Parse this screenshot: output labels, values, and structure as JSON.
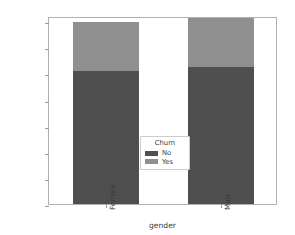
{
  "chart_data": {
    "type": "bar",
    "subtype": "stacked-bar",
    "title": "",
    "xlabel": "gender",
    "ylabel": "",
    "categories": [
      "Female",
      "Male"
    ],
    "series": [
      {
        "name": "No",
        "color": "#4f4f4f",
        "values": [
          2549,
          2625
        ]
      },
      {
        "name": "Yes",
        "color": "#8f8f8f",
        "values": [
          939,
          930
        ]
      }
    ],
    "totals": [
      3488,
      3555
    ],
    "ylim": [
      0,
      3600
    ],
    "yticks": [
      0,
      500,
      1000,
      1500,
      2000,
      2500,
      3000,
      3500
    ],
    "ytick_labels": [
      "0",
      "500",
      "1000",
      "1500",
      "2000",
      "2500",
      "3000",
      "3500"
    ],
    "xtick_labels": [
      "Female",
      "Male"
    ],
    "xtick_rotation": 90,
    "grid": false,
    "legend": {
      "title": "Churn",
      "position": "center",
      "entries": [
        {
          "label": "No",
          "color": "#4f4f4f"
        },
        {
          "label": "Yes",
          "color": "#8f8f8f"
        }
      ]
    },
    "colors": {
      "series_no": "#4f4f4f",
      "series_yes": "#8f8f8f",
      "axis": "#b0b0b0",
      "text": "#3a3a3a",
      "background": "#ffffff"
    }
  }
}
